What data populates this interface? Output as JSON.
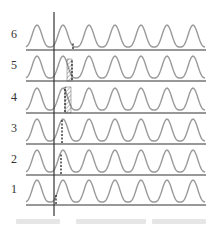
{
  "figure": {
    "type": "stacked-waveform-diagram",
    "rows": [
      {
        "label": "6",
        "baseline_y": 50,
        "marker_x": 73,
        "marker_height": 8,
        "hatch": null
      },
      {
        "label": "5",
        "baseline_y": 81,
        "marker_x": 72,
        "marker_height": 22,
        "hatch": {
          "x1": 67,
          "x2": 72
        }
      },
      {
        "label": "4",
        "baseline_y": 113,
        "marker_x": 65,
        "marker_height": 26,
        "hatch": {
          "x1": 65,
          "x2": 71
        }
      },
      {
        "label": "3",
        "baseline_y": 144,
        "marker_x": 62,
        "marker_height": 24,
        "hatch": null
      },
      {
        "label": "2",
        "baseline_y": 175,
        "marker_x": 61,
        "marker_height": 22,
        "hatch": null
      },
      {
        "label": "1",
        "baseline_y": 205,
        "marker_x": 56,
        "marker_height": 10,
        "hatch": null
      }
    ],
    "reference_line_x": 54,
    "colors": {
      "wave": "#9a9a9a",
      "axis": "#333333",
      "marker": "#222222",
      "label": "#333333",
      "caption": "#e6e6e6"
    },
    "caption": ""
  }
}
